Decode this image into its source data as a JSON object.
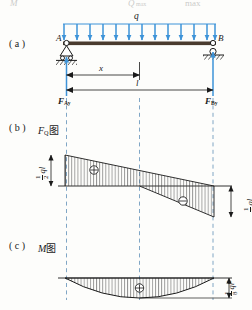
{
  "figure": {
    "top_formula_fragment_left": "M",
    "top_formula_fragment_mid": "Q",
    "top_formula_fragment_sub": "max",
    "top_formula_fragment_right": "max",
    "panels": [
      {
        "tag": "( a )",
        "caption": "",
        "name": "loading-diagram"
      },
      {
        "tag": "( b )",
        "caption": "F",
        "caption_sub": "Q",
        "caption_cn": "图",
        "name": "shear-diagram"
      },
      {
        "tag": "( c )",
        "caption": "M",
        "caption_sub": "",
        "caption_cn": "图",
        "name": "moment-diagram"
      }
    ],
    "load_label": "q",
    "node_a": "A",
    "node_b": "B",
    "dim_x": "x",
    "dim_l": "l",
    "reaction_a": "F",
    "reaction_a_sub": "Ay",
    "reaction_b": "F",
    "reaction_b_sub": "By",
    "shear_left_value": {
      "num": "1",
      "den": "2",
      "unit": "ql"
    },
    "shear_right_value": {
      "num": "1",
      "den": "2",
      "unit": "ql"
    },
    "moment_max_value": {
      "num": "1",
      "den": "8",
      "unit": "ql",
      "unit_exp": "2"
    },
    "sign_positive": "⊕",
    "sign_negative": "⊖",
    "colors": {
      "load_blue": "#3d93d8",
      "beam_dark": "#4a3b2e",
      "ink": "#1a1a1a",
      "hatch": "#3a3a3a",
      "dashed": "#5f8fb8",
      "paper": "#fdfdfb"
    }
  }
}
